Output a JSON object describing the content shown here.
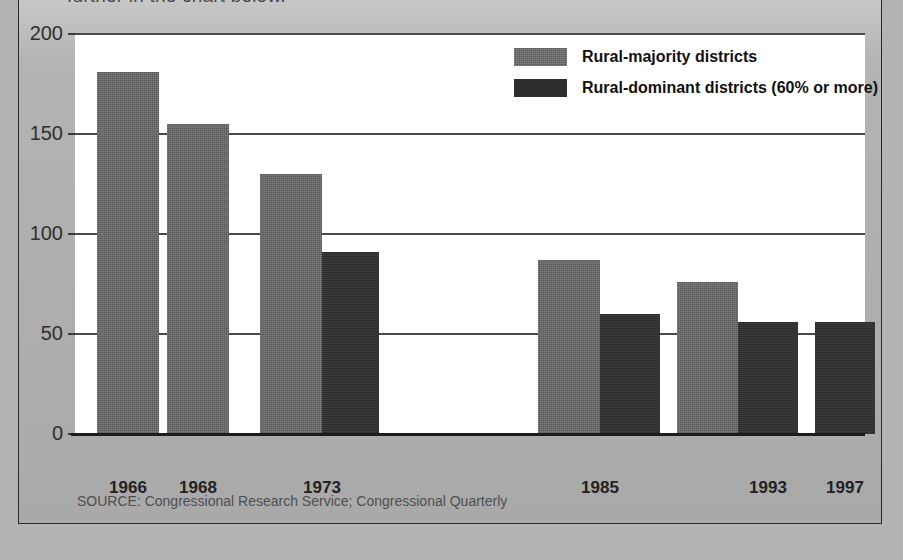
{
  "lead_text": "further in the chart below.",
  "source_note": "SOURCE: Congressional Research Service; Congressional Quarterly",
  "legend": {
    "items": [
      {
        "label": "Rural-majority districts",
        "color": "#5b5b5b",
        "key": "rural_majority"
      },
      {
        "label": "Rural-dominant districts (60% or more)",
        "color": "#2e2e2e",
        "key": "rural_dominant"
      }
    ]
  },
  "axis": {
    "y_ticks": [
      "0",
      "50",
      "100",
      "150",
      "200"
    ],
    "x_ticks": [
      "1966",
      "1968",
      "1973",
      "1985",
      "1993",
      "1997"
    ]
  },
  "colors": {
    "card_background": "#b0b0b0",
    "plot_background": "#ffffff",
    "gridline": "#4a4a4a",
    "axis": "#1c1c1c",
    "rural_majority": "#5b5b5b",
    "rural_dominant": "#2e2e2e"
  },
  "chart_data": {
    "type": "bar",
    "title": "",
    "subtitle": "",
    "xlabel": "",
    "ylabel": "",
    "ylim": [
      0,
      200
    ],
    "yticks": [
      0,
      50,
      100,
      150,
      200
    ],
    "grid": true,
    "legend_position": "top-right",
    "categories": [
      "1966",
      "1968",
      "1973",
      "1985",
      "1993",
      "1997"
    ],
    "series": [
      {
        "name": "Rural-majority districts",
        "color": "#5b5b5b",
        "values": [
          181,
          155,
          130,
          87,
          76,
          null
        ]
      },
      {
        "name": "Rural-dominant districts (60% or more)",
        "color": "#2e2e2e",
        "values": [
          null,
          null,
          91,
          60,
          56,
          56
        ]
      }
    ],
    "annotations": [
      "SOURCE: Congressional Research Service; Congressional Quarterly"
    ]
  },
  "bars": [
    {
      "category": "1966",
      "series": "rural_majority",
      "value": 181,
      "x": 22,
      "width": 62
    },
    {
      "category": "1968",
      "series": "rural_majority",
      "value": 155,
      "x": 92,
      "width": 62
    },
    {
      "category": "1973",
      "series": "rural_majority",
      "value": 130,
      "x": 185,
      "width": 62
    },
    {
      "category": "1973",
      "series": "rural_dominant",
      "value": 91,
      "x": 247,
      "width": 57
    },
    {
      "category": "1985",
      "series": "rural_majority",
      "value": 87,
      "x": 463,
      "width": 62
    },
    {
      "category": "1985",
      "series": "rural_dominant",
      "value": 60,
      "x": 525,
      "width": 60
    },
    {
      "category": "1993",
      "series": "rural_majority",
      "value": 76,
      "x": 602,
      "width": 61
    },
    {
      "category": "1993",
      "series": "rural_dominant",
      "value": 56,
      "x": 663,
      "width": 60
    },
    {
      "category": "1997",
      "series": "rural_dominant",
      "value": 56,
      "x": 740,
      "width": 60
    }
  ],
  "xlab_positions": [
    53,
    123,
    247,
    525,
    693,
    770
  ]
}
